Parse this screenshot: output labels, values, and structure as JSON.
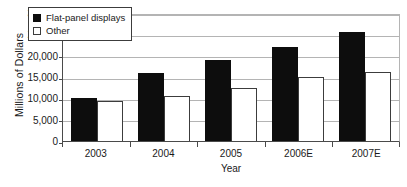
{
  "chart_data": {
    "type": "bar",
    "title": "",
    "subtitle": "",
    "xlabel": "Year",
    "ylabel": "Millions of Dollars",
    "categories": [
      "2003",
      "2004",
      "2005",
      "2006E",
      "2007E"
    ],
    "series": [
      {
        "name": "Flat-panel displays",
        "color": "#0d0d0d",
        "values": [
          10000,
          16000,
          19000,
          22000,
          25500
        ]
      },
      {
        "name": "Other",
        "color": "#ffffff",
        "values": [
          9400,
          10500,
          12500,
          15000,
          16200
        ]
      }
    ],
    "ylim": [
      0,
      30000
    ],
    "ytick_values": [
      0,
      5000,
      10000,
      15000,
      20000,
      25000,
      30000
    ],
    "ytick_labels": [
      "0",
      "5,000",
      "10,000",
      "15,000",
      "20,000",
      "25,000",
      "30,000"
    ],
    "grid": true,
    "grid_axis": "y",
    "legend_position": "top-left-inside",
    "bar_style": "grouped",
    "annotations": []
  },
  "legend": {
    "items": [
      {
        "label": "Flat-panel displays",
        "swatch": "filled-black-square"
      },
      {
        "label": "Other",
        "swatch": "open-white-square"
      }
    ]
  },
  "axes": {
    "y_title": "Millions of Dollars",
    "x_title": "Year"
  },
  "colors": {
    "series_dark": "#0d0d0d",
    "series_light": "#ffffff",
    "gridline": "#b4b4b4",
    "axis": "#4a4a4a",
    "text": "#1a1a1a",
    "background": "#ffffff"
  }
}
